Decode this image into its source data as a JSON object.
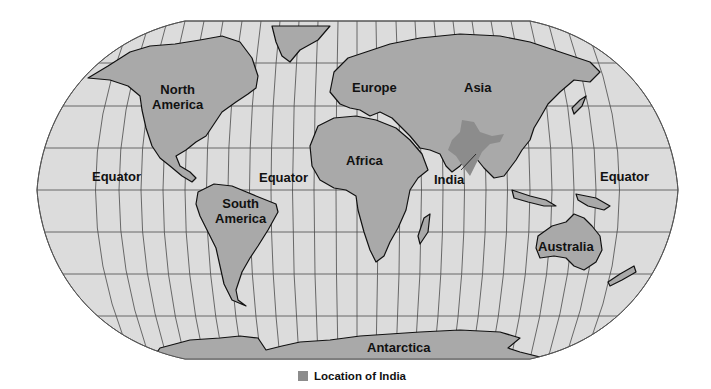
{
  "map": {
    "projection": "Robinson (world)",
    "colors": {
      "ocean": "#dcdcdc",
      "land": "#a9a9a9",
      "highlight": "#8c8c8c",
      "grid": "#4a4a4a",
      "coast": "#111111"
    },
    "labels": {
      "north_america": [
        "North",
        "America"
      ],
      "south_america": [
        "South",
        "America"
      ],
      "europe": "Europe",
      "asia": "Asia",
      "africa": "Africa",
      "india": "India",
      "australia": "Australia",
      "antarctica": "Antarctica",
      "equator_left": "Equator",
      "equator_center": "Equator",
      "equator_right": "Equator"
    }
  },
  "legend": {
    "swatch_color": "#8c8c8c",
    "label": "Location of India"
  }
}
